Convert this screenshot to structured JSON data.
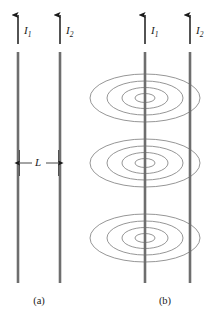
{
  "figure": {
    "background_color": "#ffffff",
    "width": 216,
    "height": 321,
    "wire_color": "#6e6e6e",
    "arrow_color": "#1a1a1a",
    "field_line_color": "#8a8a8a",
    "text_color": "#1a1a1a"
  },
  "panel_a": {
    "caption": "(a)",
    "wires": [
      {
        "label_text": "I",
        "label_sub": "1",
        "x": 18
      },
      {
        "label_text": "I",
        "label_sub": "2",
        "x": 60
      }
    ],
    "separation": {
      "label": "L",
      "from_x": 18,
      "to_x": 60,
      "y": 163
    }
  },
  "panel_b": {
    "caption": "(b)",
    "wires": [
      {
        "label_text": "I",
        "label_sub": "1",
        "x": 145
      },
      {
        "label_text": "I",
        "label_sub": "2",
        "x": 190
      }
    ],
    "field_clusters": [
      {
        "center_x": 145,
        "center_y": 98,
        "ring_count": 4
      },
      {
        "center_x": 145,
        "center_y": 163,
        "ring_count": 4
      },
      {
        "center_x": 145,
        "center_y": 238,
        "ring_count": 4
      }
    ],
    "ring_radii_x": [
      10,
      23,
      38,
      55
    ],
    "ring_radii_y": [
      4.5,
      10.5,
      17,
      24
    ]
  },
  "geometry": {
    "arrow_tip_y": 14,
    "arrow_tail_y": 44,
    "wire_top_y": 52,
    "wire_bottom_y": 283,
    "caption_y": 296
  }
}
